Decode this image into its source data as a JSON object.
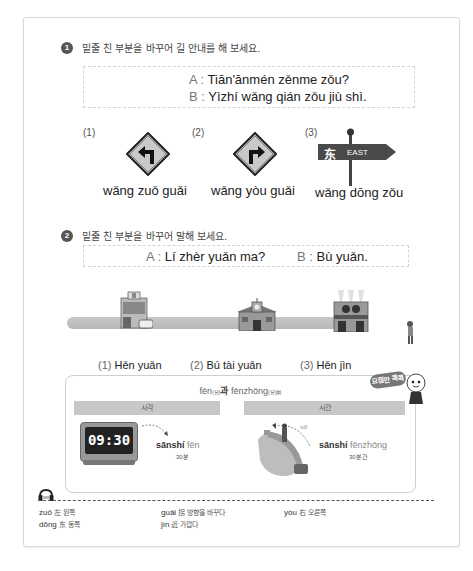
{
  "exercise1": {
    "number": "1",
    "instruction": "밑줄 친 부분을 바꾸어 길 안내를 해 보세요.",
    "dialogue": [
      {
        "speaker": "A",
        "text": "Tiān'ānmén zěnme zǒu?"
      },
      {
        "speaker": "B",
        "text": "Yìzhí wǎng qián zǒu jiù shì."
      }
    ],
    "items": [
      {
        "number": "(1)",
        "icon": "turn-left-sign-icon",
        "pinyin": "wǎng zuǒ guǎi"
      },
      {
        "number": "(2)",
        "icon": "turn-right-sign-icon",
        "pinyin": "wǎng yòu guǎi"
      },
      {
        "number": "(3)",
        "icon": "east-signpost-icon",
        "pinyin": "wǎng dōng zǒu",
        "sign_hanzi": "东",
        "sign_text": "EAST"
      }
    ]
  },
  "exercise2": {
    "number": "2",
    "instruction": "밑줄 친 부분을 바꾸어 말해 보세요.",
    "dialogue": [
      {
        "speaker": "A",
        "text": "Lí zhèr yuǎn ma?"
      },
      {
        "speaker": "B",
        "text": "Bù yuǎn."
      }
    ],
    "items": [
      {
        "number": "(1)",
        "icon": "hospital-building-icon",
        "text": "Hěn yuǎn"
      },
      {
        "number": "(2)",
        "icon": "school-building-icon",
        "text": "Bú tài yuǎn"
      },
      {
        "number": "(3)",
        "icon": "cinema-building-icon",
        "text": "Hěn jìn"
      }
    ]
  },
  "tip": {
    "badge": "요점만 콕콕",
    "title_a": "fēn",
    "title_a_note": "(分)",
    "title_mid": "과",
    "title_b": "fēnzhōng",
    "title_b_note": "(分钟)",
    "columns": [
      {
        "header": "시각",
        "clock_time": "09:30",
        "pinyin_bold": "sānshí",
        "pinyin_light": "fēn",
        "meaning": "30분"
      },
      {
        "header": "시간",
        "duration_note": "30분",
        "pinyin_bold": "sānshí",
        "pinyin_light": "fēnzhōng",
        "meaning": "30분간"
      }
    ]
  },
  "vocabulary": {
    "icon": "headphones-icon",
    "items": [
      {
        "pinyin": "zuǒ",
        "hanzi": "左",
        "meaning": "왼쪽"
      },
      {
        "pinyin": "guǎi",
        "hanzi": "拐",
        "meaning": "방향을 바꾸다"
      },
      {
        "pinyin": "yòu",
        "hanzi": "右",
        "meaning": "오른쪽"
      },
      {
        "pinyin": "dōng",
        "hanzi": "东",
        "meaning": "동쪽"
      },
      {
        "pinyin": "jìn",
        "hanzi": "近",
        "meaning": "가깝다"
      }
    ]
  }
}
